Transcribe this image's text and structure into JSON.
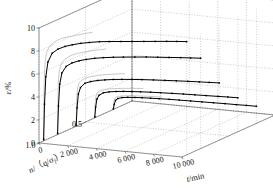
{
  "figure": {
    "kind": "3d-creep-curves",
    "background": "#ffffff",
    "curve_color": "#000000",
    "projection_color": "#9a9a9a",
    "grid_color": "#8c8c8c",
    "box_color": "#555555"
  },
  "axes": {
    "z": {
      "label_eps": "ε",
      "label_slash": "/",
      "label_unit": "%",
      "ticks": [
        "0",
        "2",
        "4",
        "6",
        "8",
        "10"
      ],
      "values": [
        0,
        2,
        4,
        6,
        8,
        10
      ],
      "range": [
        0,
        10
      ]
    },
    "depth": {
      "label_n": "n",
      "label_rest": "/（q/σ",
      "label_sub": "f",
      "label_close": "）",
      "label_full": "n/（q/σf）",
      "ticks": [
        "1.0",
        "0.5"
      ],
      "values": [
        1.0,
        0.5
      ],
      "range": [
        1.0,
        0.0
      ]
    },
    "x": {
      "label_t": "t",
      "label_unit": "/min",
      "label_full": "t/min",
      "ticks": [
        "0",
        "2 000",
        "4 000",
        "6 000",
        "8 000",
        "10 000"
      ],
      "values": [
        0,
        2000,
        4000,
        6000,
        8000,
        10000
      ],
      "range": [
        0,
        10000
      ]
    }
  },
  "chart_data": {
    "type": "line",
    "title": "",
    "xlabel": "t/min",
    "ylabel": "ε/%",
    "zlabel": "n/（q/σf）",
    "xlim": [
      0,
      10000
    ],
    "ylim": [
      0,
      10
    ],
    "zlim": [
      1.0,
      0.0
    ],
    "grid": true,
    "legend": "none",
    "marker": "square",
    "note": "Five creep strain-vs-time curves, one per stress-level n; each rises steeply at small t then plateaus. Plateau strain decreases as n decreases.",
    "series": [
      {
        "name": "n = 0.95",
        "n": 0.95,
        "t": [
          0,
          60,
          150,
          300,
          600,
          1000,
          1500,
          2000,
          2600,
          3200,
          3900,
          4600,
          5400,
          6200,
          7000,
          7800,
          8600,
          9300,
          10000
        ],
        "eps": [
          0.15,
          3.2,
          5.6,
          6.9,
          7.7,
          8.1,
          8.4,
          8.6,
          8.8,
          8.95,
          9.1,
          9.2,
          9.3,
          9.4,
          9.5,
          9.6,
          9.7,
          9.78,
          9.85
        ]
      },
      {
        "name": "n = 0.80",
        "n": 0.8,
        "t": [
          0,
          60,
          150,
          300,
          600,
          1000,
          1500,
          2000,
          2600,
          3200,
          3900,
          4600,
          5400,
          6200,
          7000,
          7800,
          8600,
          9300,
          10000
        ],
        "eps": [
          0.12,
          2.5,
          4.4,
          5.4,
          6.0,
          6.35,
          6.6,
          6.78,
          6.95,
          7.08,
          7.2,
          7.3,
          7.4,
          7.5,
          7.58,
          7.66,
          7.74,
          7.8,
          7.86
        ]
      },
      {
        "name": "n = 0.60",
        "n": 0.6,
        "t": [
          0,
          60,
          150,
          300,
          600,
          1000,
          1500,
          2000,
          2600,
          3200,
          3900,
          4600,
          5400,
          6200,
          7000,
          7800,
          8600,
          9300,
          10000
        ],
        "eps": [
          0.1,
          1.6,
          2.8,
          3.4,
          3.8,
          4.0,
          4.16,
          4.27,
          4.38,
          4.46,
          4.54,
          4.61,
          4.68,
          4.74,
          4.8,
          4.85,
          4.9,
          4.94,
          4.98
        ]
      },
      {
        "name": "n = 0.40",
        "n": 0.4,
        "t": [
          0,
          60,
          150,
          300,
          600,
          1000,
          1500,
          2000,
          2600,
          3200,
          3900,
          4600,
          5400,
          6200,
          7000,
          7800,
          8600,
          9300,
          10000
        ],
        "eps": [
          0.08,
          0.95,
          1.65,
          2.0,
          2.25,
          2.38,
          2.47,
          2.54,
          2.6,
          2.65,
          2.7,
          2.74,
          2.78,
          2.82,
          2.85,
          2.88,
          2.91,
          2.94,
          2.96
        ]
      },
      {
        "name": "n = 0.20",
        "n": 0.2,
        "t": [
          0,
          60,
          150,
          300,
          600,
          1000,
          1500,
          2000,
          2600,
          3200,
          3900,
          4600,
          5400,
          6200,
          7000,
          7800,
          8600,
          9300,
          10000
        ],
        "eps": [
          0.05,
          0.45,
          0.8,
          0.98,
          1.1,
          1.17,
          1.22,
          1.26,
          1.29,
          1.32,
          1.35,
          1.37,
          1.39,
          1.41,
          1.43,
          1.45,
          1.46,
          1.48,
          1.49
        ]
      }
    ],
    "projected_series": [
      {
        "name": "proj-0.95",
        "n": 0.95,
        "plateau": 9.85
      },
      {
        "name": "proj-0.80",
        "n": 0.8,
        "plateau": 7.86
      },
      {
        "name": "proj-0.60",
        "n": 0.6,
        "plateau": 4.98
      },
      {
        "name": "proj-0.40",
        "n": 0.4,
        "plateau": 2.96
      },
      {
        "name": "proj-0.20",
        "n": 0.2,
        "plateau": 1.49
      }
    ]
  }
}
